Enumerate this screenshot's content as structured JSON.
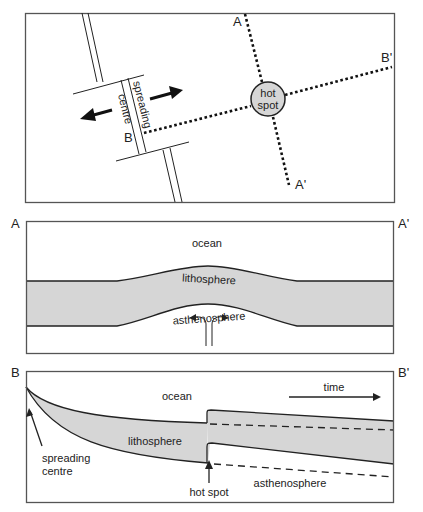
{
  "figure": {
    "panel_map": {
      "labels": {
        "a": "A",
        "a_prime": "A'",
        "b": "B",
        "b_prime": "B'",
        "hot_spot_line1": "hot",
        "hot_spot_line2": "spot",
        "ridge_word1": "spreading",
        "ridge_word2": "centre"
      },
      "colors": {
        "hot_spot_fill": "#d6d6d6"
      }
    },
    "panel_aa": {
      "labels": {
        "left": "A",
        "right": "A'",
        "ocean": "ocean",
        "lithosphere": "lithosphere",
        "asthenosphere": "asthenosphere"
      }
    },
    "panel_bb": {
      "labels": {
        "left": "B",
        "right": "B'",
        "ocean": "ocean",
        "time": "time",
        "lithosphere": "lithosphere",
        "asthenosphere": "asthenosphere",
        "spreading_line1": "spreading",
        "spreading_line2": "centre",
        "hot_spot": "hot spot"
      }
    },
    "colors": {
      "lithosphere_fill": "#d6d6d6",
      "frame": "#555555",
      "line": "#222222"
    }
  }
}
